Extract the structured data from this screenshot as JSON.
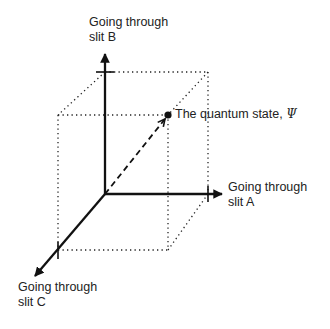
{
  "diagram": {
    "axes": {
      "b": {
        "line1": "Going through",
        "line2": "slit B"
      },
      "a": {
        "line1": "Going through",
        "line2": "slit A"
      },
      "c": {
        "line1": "Going through",
        "line2": "slit C"
      }
    },
    "state": {
      "label": "The quantum state, ",
      "symbol": "Ψ"
    },
    "colors": {
      "line": "#111111",
      "background": "#ffffff"
    }
  }
}
